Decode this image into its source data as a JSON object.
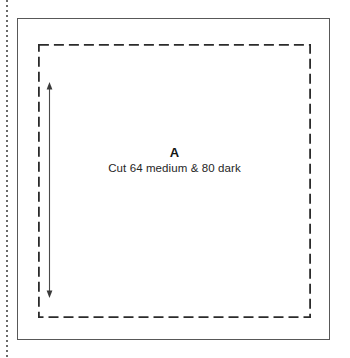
{
  "document": {
    "type": "quilting-pattern-template",
    "background_color": "#ffffff"
  },
  "guides": {
    "perforation_line": {
      "name": "page-edge-perforation",
      "orientation": "vertical",
      "color": "#6a6a6a"
    },
    "template_border": {
      "name": "template-outline",
      "shape": "rectangle",
      "style": "solid",
      "color": "#585858"
    },
    "seam_line": {
      "name": "seam-allowance-line",
      "shape": "rectangle",
      "style": "dashed",
      "color": "#2b2b2b",
      "dash": "10 5"
    },
    "grain_arrow": {
      "name": "grain-line-arrow",
      "orientation": "vertical",
      "heads": "both",
      "color": "#4a4a4a"
    }
  },
  "piece": {
    "letter": "A",
    "cut_instructions": "Cut 64 medium & 80 dark"
  }
}
